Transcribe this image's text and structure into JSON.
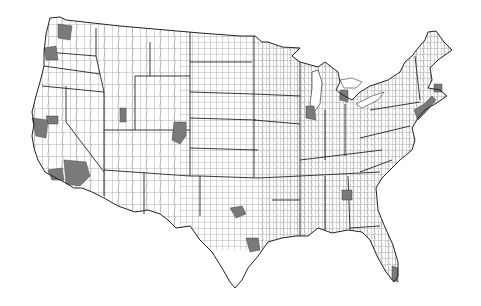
{
  "map": {
    "type": "choropleth-binary",
    "subject": "Contiguous United States county map with shaded metropolitan counties",
    "colors": {
      "background": "#ffffff",
      "county_fill": "#ffffff",
      "county_border": "#555555",
      "state_border": "#222222",
      "shaded_fill": "#7a7a7a"
    },
    "shaded_regions": [
      {
        "name": "seattle",
        "cx": 62,
        "cy": 32
      },
      {
        "name": "portland",
        "cx": 50,
        "cy": 54
      },
      {
        "name": "sf-bay-area",
        "cx": 40,
        "cy": 125
      },
      {
        "name": "sacramento",
        "cx": 52,
        "cy": 120
      },
      {
        "name": "las-vegas-san-bernardino",
        "cx": 75,
        "cy": 174
      },
      {
        "name": "los-angeles",
        "cx": 55,
        "cy": 172
      },
      {
        "name": "salt-lake",
        "cx": 123,
        "cy": 116
      },
      {
        "name": "denver",
        "cx": 180,
        "cy": 134
      },
      {
        "name": "dallas",
        "cx": 238,
        "cy": 212
      },
      {
        "name": "houston",
        "cx": 252,
        "cy": 245
      },
      {
        "name": "chicago",
        "cx": 310,
        "cy": 112
      },
      {
        "name": "detroit",
        "cx": 345,
        "cy": 96
      },
      {
        "name": "atlanta",
        "cx": 347,
        "cy": 196
      },
      {
        "name": "florida-miami",
        "cx": 393,
        "cy": 275
      },
      {
        "name": "northeast-corridor",
        "cx": 425,
        "cy": 100
      }
    ]
  }
}
